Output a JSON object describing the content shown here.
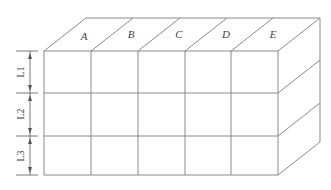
{
  "diagram": {
    "type": "3D grid box (isometric oblique view)",
    "columns": [
      "A",
      "B",
      "C",
      "D",
      "E"
    ],
    "layers": [
      "L1",
      "L2",
      "L3"
    ],
    "line_color": "#8a8a8a",
    "text_color": "#444444"
  }
}
